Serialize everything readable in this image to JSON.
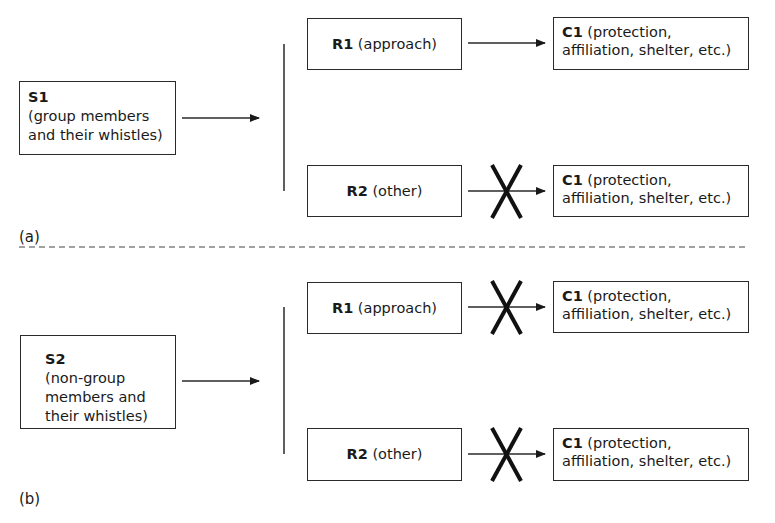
{
  "panels": [
    {
      "id": "a",
      "label": "(a)",
      "stimulus": {
        "code": "S1",
        "desc": "(group members and their whistles)",
        "line1": "(group members",
        "line2": "and their whistles)"
      },
      "responses": [
        {
          "code": "R1",
          "desc": "(approach)",
          "blocked": false,
          "consequence": {
            "code": "C1",
            "line1": "(protection,",
            "line2": "affiliation, shelter, etc.)"
          }
        },
        {
          "code": "R2",
          "desc": "(other)",
          "blocked": true,
          "consequence": {
            "code": "C1",
            "line1": "(protection,",
            "line2": "affiliation, shelter, etc.)"
          }
        }
      ]
    },
    {
      "id": "b",
      "label": "(b)",
      "stimulus": {
        "code": "S2",
        "line1": "(non-group",
        "line2": "members and",
        "line3": "their whistles)"
      },
      "responses": [
        {
          "code": "R1",
          "desc": "(approach)",
          "blocked": true,
          "consequence": {
            "code": "C1",
            "line1": "(protection,",
            "line2": "affiliation, shelter, etc.)"
          }
        },
        {
          "code": "R2",
          "desc": "(other)",
          "blocked": true,
          "consequence": {
            "code": "C1",
            "line1": "(protection,",
            "line2": "affiliation, shelter, etc.)"
          }
        }
      ]
    }
  ],
  "colors": {
    "line": "#2a2a2a",
    "x_mark": "#111111",
    "background": "#ffffff"
  }
}
